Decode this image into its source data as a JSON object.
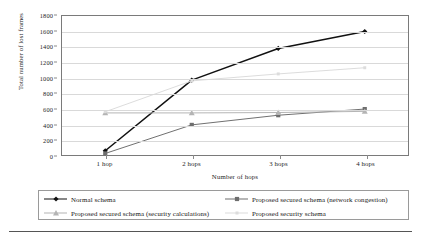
{
  "chart_data": {
    "type": "line",
    "title": "",
    "xlabel": "Number of hops",
    "ylabel": "Total number of lost frames",
    "categories": [
      "1 hop",
      "2 hops",
      "3 hops",
      "4 hops"
    ],
    "ylim": [
      0,
      1800
    ],
    "ytick_step": 200,
    "yticks": [
      "1800",
      "1600",
      "1400",
      "1200",
      "1000",
      "800",
      "600",
      "400",
      "200",
      "0"
    ],
    "ytick_values": [
      1800,
      1600,
      1400,
      1200,
      1000,
      800,
      600,
      400,
      200,
      0
    ],
    "grid": true,
    "legend_position": "below",
    "series": [
      {
        "name": "Normal schema",
        "values": [
          55,
          970,
          1380,
          1600
        ],
        "color": "#111111",
        "marker": "diamond",
        "line_width": 1.5
      },
      {
        "name": "Proposed secured schema (network congestion)",
        "values": [
          20,
          390,
          515,
          595
        ],
        "color": "#6e6e6e",
        "marker": "square",
        "line_width": 1.0
      },
      {
        "name": "Proposed secured schema (security calculations)",
        "values": [
          545,
          545,
          550,
          565
        ],
        "color": "#b4b4b4",
        "marker": "triangle",
        "line_width": 1.0
      },
      {
        "name": "Proposed security schema",
        "values": [
          560,
          960,
          1050,
          1130
        ],
        "color": "#dcdcdc",
        "marker": "square-small",
        "line_width": 1.0
      }
    ]
  },
  "axis": {
    "y_title": "Total number of lost frames",
    "x_title": "Number of hops"
  },
  "legend": {
    "entries": [
      {
        "label": "Normal schema"
      },
      {
        "label": "Proposed secured schema (network congestion)"
      },
      {
        "label": "Proposed secured schema (security calculations)"
      },
      {
        "label": "Proposed security schema"
      }
    ]
  }
}
